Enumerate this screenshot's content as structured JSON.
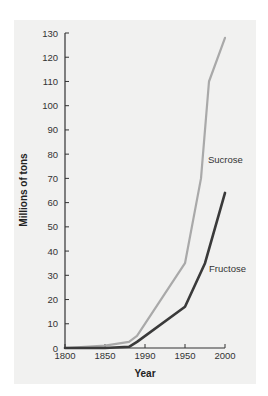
{
  "chart_data": {
    "type": "line",
    "title": "",
    "xlabel": "Year",
    "ylabel": "Millions of tons",
    "x_tick_labels": [
      "1800",
      "1850",
      "1990",
      "1950",
      "2000"
    ],
    "x_tick_values": [
      1800,
      1850,
      1900,
      1950,
      2000
    ],
    "y_ticks": [
      0,
      10,
      20,
      30,
      40,
      50,
      60,
      70,
      80,
      90,
      100,
      110,
      120,
      130
    ],
    "xlim": [
      1800,
      2000
    ],
    "ylim": [
      0,
      130
    ],
    "grid": false,
    "legend": "inline labels",
    "series": [
      {
        "name": "Sucrose",
        "color": "#a9a9a9",
        "points": [
          [
            1800,
            0
          ],
          [
            1850,
            1
          ],
          [
            1880,
            2.5
          ],
          [
            1890,
            5
          ],
          [
            1950,
            35
          ],
          [
            1970,
            70
          ],
          [
            1980,
            110
          ],
          [
            2000,
            128
          ]
        ]
      },
      {
        "name": "Fructose",
        "color": "#3a3a3a",
        "points": [
          [
            1800,
            0
          ],
          [
            1850,
            0
          ],
          [
            1880,
            0.5
          ],
          [
            1890,
            2.5
          ],
          [
            1950,
            17
          ],
          [
            1975,
            35
          ],
          [
            2000,
            64
          ]
        ]
      }
    ]
  },
  "labels": {
    "xlabel": "Year",
    "ylabel": "Millions of tons",
    "sucrose": "Sucrose",
    "fructose": "Fructose"
  }
}
